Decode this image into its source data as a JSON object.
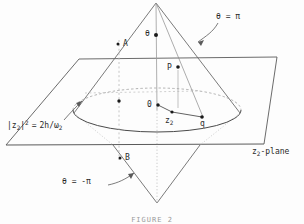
{
  "figure": {
    "caption": "FIGURE 2",
    "labels": {
      "theta_pi": "θ = π",
      "theta_minus_pi": "θ = -π",
      "theta_vertex": "θ",
      "point_a": "A",
      "point_b": "B",
      "point_p": "P",
      "point_o": "0",
      "point_q": "q",
      "point_z2": "z",
      "point_z2_sub": "2",
      "plane_name": "z",
      "plane_name_sub": "2",
      "plane_name_tail": "-plane",
      "radius_lhs_base": "|z",
      "radius_lhs_sub": "2",
      "radius_lhs_close": "|",
      "radius_lhs_sup": "2",
      "radius_eq": "=",
      "radius_rhs_num": "2h/",
      "radius_rhs_omega": "ω",
      "radius_rhs_sub": "2"
    },
    "colors": {
      "stroke": "#4a4a4a",
      "stroke_light": "#8e8e8e",
      "stroke_dotted": "#b4b4b4",
      "point": "#1a1a1a",
      "text": "#2a2a2a",
      "background": "#fdfdfd"
    },
    "geometry": {
      "upper_apex": [
        156,
        3
      ],
      "lower_apex": [
        157,
        203
      ],
      "plane_corners": [
        [
          79,
          59
        ],
        [
          277,
          57
        ],
        [
          264,
          144
        ],
        [
          6,
          145
        ]
      ],
      "ellipse_center": [
        157,
        110
      ],
      "ellipse_rx": 84,
      "ellipse_ry": 22,
      "points": {
        "A": [
          118,
          44
        ],
        "B": [
          120,
          158
        ],
        "P": [
          178,
          67
        ],
        "O": [
          158,
          105
        ],
        "z2": [
          172,
          112
        ],
        "q": [
          203,
          117
        ],
        "theta": [
          153,
          35
        ],
        "axis_mid": [
          118,
          101
        ]
      }
    }
  }
}
